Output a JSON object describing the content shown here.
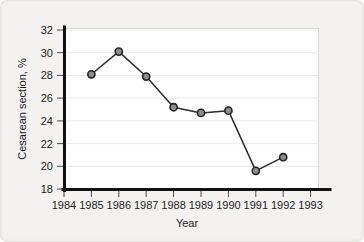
{
  "chart_data": {
    "type": "line",
    "title": "",
    "xlabel": "Year",
    "ylabel": "Cesarean section, %",
    "x": [
      1985,
      1986,
      1987,
      1988,
      1989,
      1990,
      1991,
      1992
    ],
    "values": [
      28.1,
      30.1,
      27.9,
      25.2,
      24.7,
      24.9,
      19.6,
      20.8
    ],
    "xtick_labels": [
      "1984",
      "1985",
      "1986",
      "1987",
      "1988",
      "1989",
      "1990",
      "1991",
      "1992",
      "1993"
    ],
    "xticks": [
      1984,
      1985,
      1986,
      1987,
      1988,
      1989,
      1990,
      1991,
      1992,
      1993
    ],
    "ytick_labels": [
      "18",
      "20",
      "22",
      "24",
      "26",
      "28",
      "30",
      "32"
    ],
    "yticks": [
      18,
      20,
      22,
      24,
      26,
      28,
      30,
      32
    ],
    "xlim": [
      1984,
      1993
    ],
    "ylim": [
      18,
      32
    ],
    "grid": "horizontal",
    "legend": "none",
    "series_name": "Cesarean section rate",
    "marker": "circle",
    "marker_fill": "#8d8d8d",
    "marker_edge": "#232323",
    "line_color": "#2b2b2b",
    "plot_background": "#ffffff",
    "figure_background": "#f3f2f0",
    "gridline_color": "#e3e3e1"
  }
}
